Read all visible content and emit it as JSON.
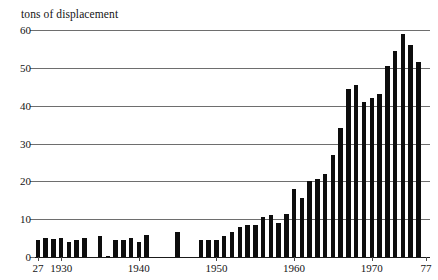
{
  "chart_data": {
    "type": "bar",
    "title": "tons of displacement",
    "xlabel": "",
    "ylabel": "tons of displacement",
    "ylim": [
      0,
      60
    ],
    "yticks": [
      0,
      10,
      20,
      30,
      40,
      50,
      60
    ],
    "ytick_labels": [
      "0",
      "10",
      "20",
      "30",
      "40",
      "50",
      "60"
    ],
    "xlim": [
      1926.5,
      1977.5
    ],
    "xticks": [
      1927,
      1930,
      1940,
      1950,
      1960,
      1970,
      1977
    ],
    "xtick_labels": [
      "27",
      "1930",
      "1940",
      "1950",
      "1960",
      "1970",
      "77"
    ],
    "grid": true,
    "legend": "none",
    "bar_color": "#0d0d0d",
    "gridline_color": "#6e6e6e",
    "categories": [
      1927,
      1928,
      1929,
      1930,
      1931,
      1932,
      1933,
      1934,
      1935,
      1936,
      1937,
      1938,
      1939,
      1940,
      1941,
      1942,
      1943,
      1944,
      1945,
      1946,
      1947,
      1948,
      1949,
      1950,
      1951,
      1952,
      1953,
      1954,
      1955,
      1956,
      1957,
      1958,
      1959,
      1960,
      1961,
      1962,
      1963,
      1964,
      1965,
      1966,
      1967,
      1968,
      1969,
      1970,
      1971,
      1972,
      1973,
      1974,
      1975,
      1976,
      1977
    ],
    "values": [
      4.5,
      5.0,
      4.8,
      5.0,
      4.0,
      4.5,
      5.0,
      0.0,
      5.5,
      0.3,
      4.5,
      4.5,
      5.0,
      4.0,
      5.8,
      0.0,
      0.0,
      0.0,
      6.5,
      0.0,
      0.0,
      4.5,
      4.5,
      4.5,
      5.5,
      6.5,
      8.0,
      8.5,
      8.5,
      10.5,
      11.0,
      9.0,
      11.5,
      18.0,
      15.5,
      20.0,
      20.5,
      22.0,
      27.0,
      34.0,
      44.5,
      45.5,
      41.0,
      42.0,
      43.0,
      50.5,
      54.5,
      59.0,
      56.0,
      51.5,
      0.0
    ]
  }
}
